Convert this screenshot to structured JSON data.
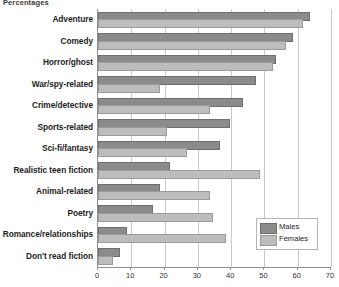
{
  "chart_data": {
    "type": "bar",
    "orientation": "horizontal",
    "title": "Percentages",
    "xlabel": "",
    "ylabel": "",
    "xlim": [
      0,
      70
    ],
    "xticks": [
      0,
      10,
      20,
      30,
      40,
      50,
      60,
      70
    ],
    "grid": true,
    "legend_position": "inside-bottom-right",
    "categories": [
      "Adventure",
      "Comedy",
      "Horror/ghost",
      "War/spy-related",
      "Crime/detective",
      "Sports-related",
      "Sci-fi/fantasy",
      "Realistic teen fiction",
      "Animal-related",
      "Poetry",
      "Romance/relationships",
      "Don't read fiction"
    ],
    "series": [
      {
        "name": "Males",
        "color": "#8b8b8b",
        "values": [
          63,
          58,
          53,
          47,
          43,
          39,
          36,
          21,
          18,
          16,
          8,
          6
        ]
      },
      {
        "name": "Females",
        "color": "#bdbdbd",
        "values": [
          61,
          56,
          52,
          18,
          33,
          20,
          26,
          48,
          33,
          34,
          38,
          4
        ]
      }
    ]
  },
  "legend": {
    "items": [
      {
        "label": "Males"
      },
      {
        "label": "Females"
      }
    ]
  },
  "axis": {
    "tick_labels": [
      "0",
      "10",
      "20",
      "30",
      "40",
      "50",
      "60",
      "70"
    ]
  }
}
